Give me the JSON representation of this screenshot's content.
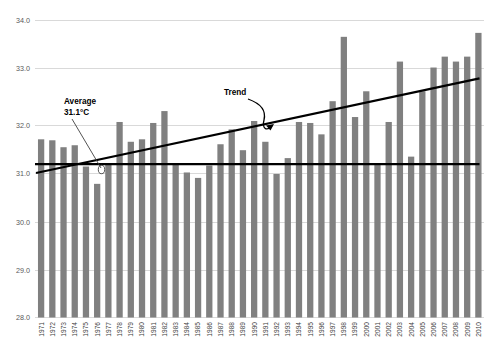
{
  "chart_data": {
    "type": "bar",
    "title": "",
    "subtitle": "",
    "xlabel": "",
    "ylabel": "",
    "ylim": [
      28.0,
      34.0
    ],
    "ytick_step": 1.0,
    "ytick_labels": [
      "34.0",
      "33.0",
      "32.0",
      "31.0",
      "30.0",
      "29.0",
      "28.0"
    ],
    "ytick_values": [
      34.0,
      33.0,
      32.0,
      31.0,
      30.0,
      29.0,
      28.0
    ],
    "grid": true,
    "legend": "none",
    "bar_color": "#808080",
    "line_color": "#000000",
    "gridline_color": "#d9d9d9",
    "categories": [
      "1971",
      "1972",
      "1973",
      "1974",
      "1975",
      "1976",
      "1977",
      "1978",
      "1979",
      "1980",
      "1981",
      "1982",
      "1983",
      "1984",
      "1985",
      "1986",
      "1987",
      "1988",
      "1989",
      "1990",
      "1991",
      "1992",
      "1993",
      "1994",
      "1995",
      "1996",
      "1997",
      "1998",
      "1999",
      "2000",
      "2001",
      "2002",
      "2003",
      "2004",
      "2005",
      "2006",
      "2007",
      "2008",
      "2009",
      "2010"
    ],
    "values": [
      31.6,
      31.58,
      31.44,
      31.48,
      31.05,
      30.7,
      31.12,
      31.95,
      31.55,
      31.6,
      31.93,
      32.17,
      31.12,
      30.93,
      30.82,
      31.07,
      31.5,
      31.8,
      31.38,
      31.97,
      31.55,
      30.9,
      31.22,
      31.95,
      31.93,
      31.7,
      32.37,
      33.67,
      32.05,
      32.57,
      31.08,
      31.95,
      33.17,
      31.25,
      32.57,
      33.05,
      33.27,
      33.17,
      33.27,
      33.75
    ],
    "series": [
      {
        "name": "Annual temperature",
        "type": "bar",
        "values": [
          31.6,
          31.58,
          31.44,
          31.48,
          31.05,
          30.7,
          31.12,
          31.95,
          31.55,
          31.6,
          31.93,
          32.17,
          31.12,
          30.93,
          30.82,
          31.07,
          31.5,
          31.8,
          31.38,
          31.97,
          31.55,
          30.9,
          31.22,
          31.95,
          31.93,
          31.7,
          32.37,
          33.67,
          32.05,
          32.57,
          31.08,
          31.95,
          33.17,
          31.25,
          32.57,
          33.05,
          33.27,
          33.17,
          33.27,
          33.75
        ]
      },
      {
        "name": "Average",
        "type": "line",
        "value": 31.1,
        "label": "Average\n31.1°C"
      },
      {
        "name": "Trend",
        "type": "line",
        "start_value": 30.92,
        "end_value": 32.83,
        "label": "Trend"
      }
    ],
    "annotations": [
      {
        "name": "average-annotation",
        "line1": "Average",
        "line2": "31.1°C"
      },
      {
        "name": "trend-annotation",
        "text": "Trend"
      }
    ]
  }
}
